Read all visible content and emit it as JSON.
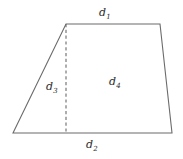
{
  "figure": {
    "name": "trapezoid-with-height",
    "background_color": "#ffffff",
    "stroke_color": "#6b6b6b",
    "dashed_stroke_color": "#6b6b6b",
    "text_color": "#2b2b2b",
    "outline": {
      "vertices": [
        {
          "name": "bottom-left",
          "x": 13,
          "y": 133
        },
        {
          "name": "top-left",
          "x": 66,
          "y": 24
        },
        {
          "name": "top-right",
          "x": 160,
          "y": 24
        },
        {
          "name": "bottom-right",
          "x": 172,
          "y": 133
        }
      ]
    },
    "height_line": {
      "name": "altitude",
      "style": "dashed",
      "x": 66,
      "y_top": 24,
      "y_bottom": 133
    },
    "labels": [
      {
        "key": "d1",
        "base": "d",
        "sub": "1",
        "position": "above-top-edge",
        "x": 99,
        "y": 7
      },
      {
        "key": "d3",
        "base": "d",
        "sub": "3",
        "position": "left-of-altitude",
        "x": 46,
        "y": 81
      },
      {
        "key": "d4",
        "base": "d",
        "sub": "4",
        "position": "interior-center",
        "x": 109,
        "y": 76
      },
      {
        "key": "d2",
        "base": "d",
        "sub": "2",
        "position": "below-bottom-edge",
        "x": 86,
        "y": 139
      }
    ]
  }
}
